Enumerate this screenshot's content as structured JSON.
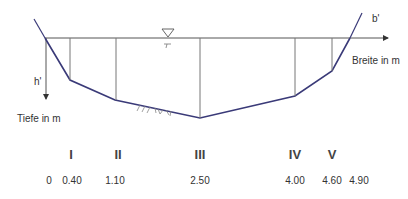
{
  "diagram": {
    "colors": {
      "bed_line": "#3a3a78",
      "axis_line": "#555555",
      "vertical_line": "#777777",
      "text": "#333333"
    },
    "axes": {
      "horizontal_symbol": "b'",
      "horizontal_label": "Breite in m",
      "vertical_symbol": "h'",
      "vertical_label": "Tiefe in m"
    },
    "water_level_symbol": "water-level-triangle-icon",
    "bed_hatching": "ground-hatching",
    "sections": [
      {
        "roman": "I",
        "position": "0.40"
      },
      {
        "roman": "II",
        "position": "1.10"
      },
      {
        "roman": "III",
        "position": "2.50"
      },
      {
        "roman": "IV",
        "position": "4.00"
      },
      {
        "roman": "V",
        "position": "4.60"
      }
    ],
    "positions": [
      "0",
      "0.40",
      "1.10",
      "2.50",
      "4.00",
      "4.60",
      "4.90"
    ]
  }
}
